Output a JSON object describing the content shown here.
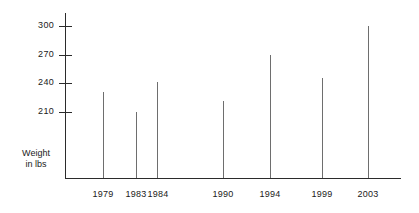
{
  "chart_data": {
    "type": "bar",
    "title": "",
    "subtitle": "",
    "xlabel": "",
    "ylabel": "Weight in lbs",
    "ylabel_line1": "Weight",
    "ylabel_line2": "in lbs",
    "categories": [
      "1979",
      "1983",
      "1984",
      "1990",
      "1994",
      "1999",
      "2003"
    ],
    "values": [
      231,
      210,
      241,
      222,
      270,
      246,
      300
    ],
    "ytick_labels": [
      "300",
      "270",
      "240",
      "210"
    ],
    "ytick_values": [
      300,
      270,
      240,
      210
    ],
    "ylim": [
      180,
      310
    ],
    "grid": false,
    "legend": "none",
    "series": [
      {
        "name": "Weight",
        "values": [
          231,
          210,
          241,
          222,
          270,
          246,
          300
        ]
      }
    ],
    "points": [
      {
        "x": "1979",
        "y": 231
      },
      {
        "x": "1983",
        "y": 210
      },
      {
        "x": "1984",
        "y": 241
      },
      {
        "x": "1990",
        "y": 222
      },
      {
        "x": "1994",
        "y": 270
      },
      {
        "x": "1999",
        "y": 246
      },
      {
        "x": "2003",
        "y": 300
      }
    ],
    "colors": {
      "axis": "#2b2b2b",
      "bar": "#6e6e6e",
      "text": "#1a1a1a",
      "background": "#ffffff"
    }
  }
}
